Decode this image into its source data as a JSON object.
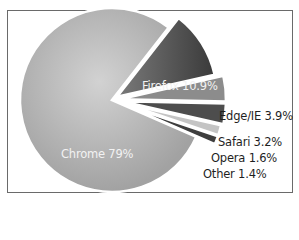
{
  "chart_data": {
    "type": "pie",
    "title": "",
    "exploded": true,
    "legend": "none",
    "labels_style": "category name with percentage",
    "slices": [
      {
        "name": "Chrome",
        "value": 79,
        "label": "Chrome 79%",
        "color": "#a9a9a9",
        "exploded": false,
        "label_position": "inside"
      },
      {
        "name": "Firefox",
        "value": 10.9,
        "label": "Firefox 10.9%",
        "color": "#555555",
        "exploded": true,
        "label_position": "inside"
      },
      {
        "name": "Edge/IE",
        "value": 3.9,
        "label": "Edge/IE 3.9%",
        "color": "#8c8c8c",
        "exploded": true,
        "label_position": "outside"
      },
      {
        "name": "Safari",
        "value": 3.2,
        "label": "Safari 3.2%",
        "color": "#4d4d4d",
        "exploded": true,
        "label_position": "outside"
      },
      {
        "name": "Opera",
        "value": 1.6,
        "label": "Opera 1.6%",
        "color": "#c4c4c4",
        "exploded": true,
        "label_position": "outside"
      },
      {
        "name": "Other",
        "value": 1.4,
        "label": "Other 1.4%",
        "color": "#3e3e3e",
        "exploded": true,
        "label_position": "outside"
      }
    ]
  },
  "labels": {
    "chrome": "Chrome 79%",
    "firefox": "Firefox 10.9%",
    "edge": "Edge/IE 3.9%",
    "safari": "Safari 3.2%",
    "opera": "Opera 1.6%",
    "other": "Other 1.4%"
  }
}
